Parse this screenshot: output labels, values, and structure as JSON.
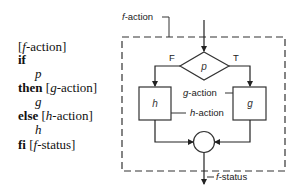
{
  "code": {
    "lines": [
      {
        "kw": "",
        "pre": "[",
        "var": "f",
        "post": "-action]",
        "indent": false
      },
      {
        "kw": "if",
        "pre": "",
        "var": "",
        "post": "",
        "indent": false
      },
      {
        "kw": "",
        "pre": "",
        "var": "p",
        "post": "",
        "indent": true
      },
      {
        "kw": "then",
        "pre": " [",
        "var": "g",
        "post": "-action]",
        "indent": false
      },
      {
        "kw": "",
        "pre": "",
        "var": "g",
        "post": "",
        "indent": true
      },
      {
        "kw": "else",
        "pre": " [",
        "var": "h",
        "post": "-action]",
        "indent": false
      },
      {
        "kw": "",
        "pre": "",
        "var": "h",
        "post": "",
        "indent": true
      },
      {
        "kw": "fi",
        "pre": " [",
        "var": "f",
        "post": "-status]",
        "indent": false
      }
    ]
  },
  "flowchart": {
    "entry_label": {
      "var": "f",
      "rest": "-action"
    },
    "exit_label": {
      "var": "f",
      "rest": "-status"
    },
    "decision": {
      "label": "p",
      "false_label": "F",
      "true_label": "T"
    },
    "false_box": {
      "label": "h"
    },
    "true_box": {
      "label": "g"
    },
    "g_action_label": {
      "var": "g",
      "rest": "-action"
    },
    "h_action_label": {
      "var": "h",
      "rest": "-action"
    }
  }
}
